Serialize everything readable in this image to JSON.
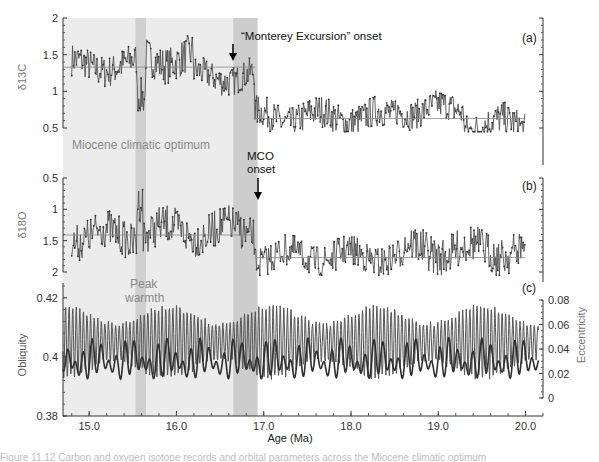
{
  "figure": {
    "caption_partial": "Figure 11.12  Carbon and oxygen isotope records and orbital parameters across the Miocene climatic optimum"
  },
  "colors": {
    "mco_shade": "#ececec",
    "peak_band": "#cfcfcf",
    "onset_band": "#cdcdcd",
    "series": "#444444",
    "mean_line": "#888888",
    "obliquity": "#555555",
    "eccentricity": "#2f2f2f"
  },
  "annotations": {
    "monterey": "“Monterey Excursion” onset",
    "mco_onset_line1": "MCO",
    "mco_onset_line2": "onset",
    "miocene_optimum": "Miocene climatic optimum",
    "peak_line1": "Peak",
    "peak_line2": "warmth"
  },
  "chart_data": [
    {
      "panel": "(a)",
      "type": "line",
      "ylabel": "δ13C",
      "y_ticks": [
        "2",
        "1.5",
        "1",
        "0.5"
      ],
      "ylim": [
        0.5,
        2.0
      ],
      "inverted": false,
      "mean_levels": [
        {
          "from": 14.7,
          "to": 16.9,
          "value": 1.33
        },
        {
          "from": 16.9,
          "to": 20.0,
          "value": 0.63
        }
      ],
      "segments": [
        {
          "from": 14.8,
          "to": 15.55,
          "mean": 1.35,
          "amp": 0.22
        },
        {
          "from": 15.55,
          "to": 15.65,
          "mean": 0.85,
          "amp": 0.25
        },
        {
          "from": 15.65,
          "to": 16.2,
          "mean": 1.45,
          "amp": 0.25
        },
        {
          "from": 16.2,
          "to": 16.9,
          "mean": 1.2,
          "amp": 0.2
        },
        {
          "from": 16.9,
          "to": 18.5,
          "mean": 0.65,
          "amp": 0.22
        },
        {
          "from": 18.5,
          "to": 19.3,
          "mean": 0.75,
          "amp": 0.2
        },
        {
          "from": 19.3,
          "to": 20.0,
          "mean": 0.55,
          "amp": 0.22
        }
      ]
    },
    {
      "panel": "(b)",
      "type": "line",
      "ylabel": "δ18O",
      "y_ticks": [
        "0.5",
        "1",
        "1.5",
        "2"
      ],
      "ylim": [
        0.5,
        2.0
      ],
      "inverted": true,
      "mean_levels": [
        {
          "from": 14.7,
          "to": 16.9,
          "value": 1.41
        },
        {
          "from": 16.9,
          "to": 20.0,
          "value": 1.77
        }
      ],
      "segments": [
        {
          "from": 14.8,
          "to": 15.55,
          "mean": 1.42,
          "amp": 0.3
        },
        {
          "from": 15.55,
          "to": 15.62,
          "mean": 0.8,
          "amp": 0.3
        },
        {
          "from": 15.62,
          "to": 16.9,
          "mean": 1.35,
          "amp": 0.3
        },
        {
          "from": 16.9,
          "to": 18.6,
          "mean": 1.75,
          "amp": 0.25
        },
        {
          "from": 18.6,
          "to": 20.0,
          "mean": 1.65,
          "amp": 0.3
        }
      ]
    },
    {
      "panel": "(c)",
      "type": "line",
      "ylabel_left": "Obliquity",
      "ylabel_right": "Eccentricity",
      "y_ticks_left": [
        "0.42",
        "0.4",
        "0.38"
      ],
      "ylim_left": [
        0.38,
        0.425
      ],
      "y_ticks_right": [
        "0.08",
        "0.06",
        "0.04",
        "0.02",
        "0"
      ],
      "ylim_right": [
        0.0,
        0.08
      ],
      "series": [
        {
          "name": "Obliquity",
          "period_ma": 0.041,
          "mean": 0.405,
          "amp": 0.012
        },
        {
          "name": "Eccentricity",
          "period_ma": 0.1,
          "mean": 0.03,
          "amp": 0.015
        }
      ]
    }
  ],
  "x_axis": {
    "label": "Age (Ma)",
    "ticks": [
      "15.0",
      "16.0",
      "17.0",
      "18.0",
      "19.0",
      "20.0"
    ],
    "xlim": [
      14.7,
      20.2
    ]
  },
  "bands": [
    {
      "name": "Miocene climatic optimum",
      "from": 14.7,
      "to": 16.65
    },
    {
      "name": "Peak warmth",
      "from": 15.53,
      "to": 15.65
    },
    {
      "name": "MCO onset interval",
      "from": 16.65,
      "to": 16.93
    }
  ]
}
